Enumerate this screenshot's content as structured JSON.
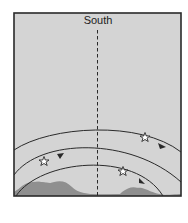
{
  "diagram": {
    "direction_label": "South",
    "caption": "",
    "colors": {
      "sky": "#d4d4d4",
      "ground": "#8f8f8f",
      "frame": "#2a2a2a",
      "arc": "#2a2a2a",
      "meridian": "#2a2a2a",
      "star_fill": "#ffffff"
    },
    "arcs": [
      {
        "name": "outer-star-path",
        "star": true,
        "arrow": true
      },
      {
        "name": "middle-star-path",
        "star": true,
        "arrow": true
      },
      {
        "name": "inner-star-path",
        "star": true,
        "arrow": true
      }
    ]
  }
}
